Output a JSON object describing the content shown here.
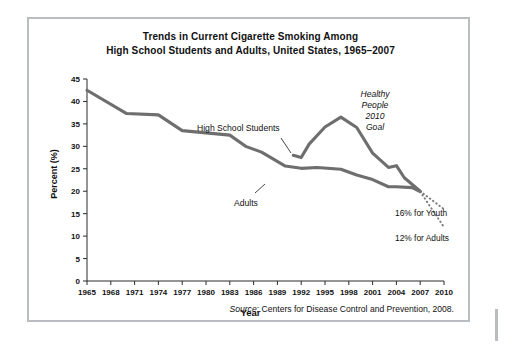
{
  "figure": {
    "title_line1": "Trends in Current Cigarette Smoking Among",
    "title_line2": "High School Students and Adults, United States, 1965–2007",
    "source_word": "Source",
    "source_rest": ": Centers for Disease Control and Prevention, 2008.",
    "frame_color": "#b9bdc2",
    "line_color": "#6e6e6e"
  },
  "annotations": {
    "hs_label": "High School Students",
    "adults_label": "Adults",
    "goal_line1": "Healthy",
    "goal_line2": "People",
    "goal_line3": "2010",
    "goal_line4": "Goal",
    "youth_target_label": "16% for Youth",
    "adults_target_label": "12% for Adults"
  },
  "chart_data": {
    "type": "line",
    "title": "Trends in Current Cigarette Smoking Among High School Students and Adults, United States, 1965–2007",
    "xlabel": "Year",
    "ylabel": "Percent (%)",
    "xlim": [
      1965,
      2010
    ],
    "ylim": [
      0,
      45
    ],
    "ytick_labels": [
      "0",
      "5",
      "10",
      "15",
      "20",
      "25",
      "30",
      "35",
      "40",
      "45"
    ],
    "yticks": [
      0,
      5,
      10,
      15,
      20,
      25,
      30,
      35,
      40,
      45
    ],
    "xtick_labels": [
      "1965",
      "1968",
      "1971",
      "1974",
      "1977",
      "1980",
      "1983",
      "1986",
      "1989",
      "1992",
      "1995",
      "1998",
      "2001",
      "2004",
      "2007",
      "2010"
    ],
    "xticks": [
      1965,
      1968,
      1971,
      1974,
      1977,
      1980,
      1983,
      1986,
      1989,
      1992,
      1995,
      1998,
      2001,
      2004,
      2007,
      2010
    ],
    "grid": false,
    "legend": "inline-labels",
    "series": [
      {
        "name": "Adults",
        "x": [
          1965,
          1970,
          1974,
          1977,
          1980,
          1983,
          1985,
          1987,
          1990,
          1992,
          1994,
          1997,
          1999,
          2001,
          2003,
          2004,
          2006,
          2007
        ],
        "values": [
          42.5,
          37.3,
          37.0,
          33.5,
          33.0,
          32.5,
          30.0,
          28.7,
          25.6,
          25.1,
          25.3,
          24.9,
          23.6,
          22.6,
          21.0,
          21.0,
          20.8,
          19.9
        ]
      },
      {
        "name": "High School Students",
        "x": [
          1991,
          1992,
          1993,
          1995,
          1997,
          1999,
          2001,
          2003,
          2004,
          2005,
          2007
        ],
        "values": [
          28.0,
          27.5,
          30.5,
          34.3,
          36.5,
          34.2,
          28.5,
          25.3,
          25.7,
          23.0,
          20.0
        ]
      }
    ],
    "projections": [
      {
        "name": "16% for Youth",
        "x": [
          2007,
          2010
        ],
        "values": [
          20.0,
          16.0
        ],
        "style": "dotted",
        "label": "16% for Youth"
      },
      {
        "name": "12% for Adults",
        "x": [
          2007,
          2010
        ],
        "values": [
          19.9,
          12.0
        ],
        "style": "dotted",
        "label": "12% for Adults"
      }
    ],
    "annotations": [
      {
        "text": "High School Students",
        "x": 1989,
        "y": 38.5
      },
      {
        "text": "Adults",
        "x": 1987,
        "y": 21.5
      },
      {
        "text": "Healthy People 2010 Goal",
        "x": 2005,
        "y": 43
      }
    ]
  }
}
